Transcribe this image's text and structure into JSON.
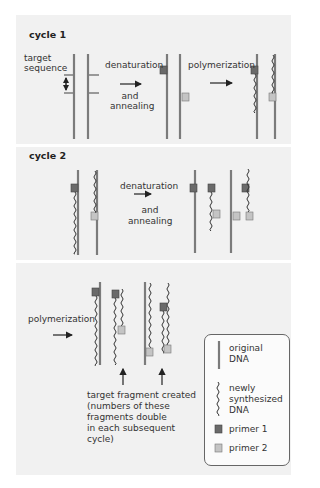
{
  "cycle1": {
    "title": "cycle 1",
    "target_label_line1": "target",
    "target_label_line2": "sequence",
    "step1_top": "denaturation",
    "step1_bottom_line1": "and",
    "step1_bottom_line2": "annealing",
    "step2": "polymerization"
  },
  "cycle2": {
    "title": "cycle 2",
    "step_top": "denaturation",
    "step_bottom_line1": "and",
    "step_bottom_line2": "annealing"
  },
  "cycle3": {
    "step": "polymerization",
    "caption_lines": [
      "target fragment created",
      "(numbers of these",
      "fragments double",
      "in each subsequent",
      "cycle)"
    ]
  },
  "legend": {
    "items": [
      {
        "name": "original-dna",
        "lines": [
          "original",
          "DNA"
        ]
      },
      {
        "name": "newly-synthesized-dna",
        "lines": [
          "newly",
          "synthesized",
          "DNA"
        ]
      },
      {
        "name": "primer-1",
        "lines": [
          "primer 1"
        ]
      },
      {
        "name": "primer-2",
        "lines": [
          "primer 2"
        ]
      }
    ]
  },
  "colors": {
    "original_dna": "#7b7b7b",
    "new_dna": "#333333",
    "primer1": "#6a6a6a",
    "primer2": "#c4c4c4",
    "panel_bg": "#f1f1f1",
    "arrow": "#222222"
  }
}
